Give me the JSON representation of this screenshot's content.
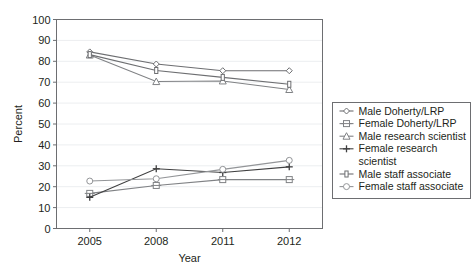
{
  "chart_data": {
    "type": "line",
    "title": "",
    "xlabel": "Year",
    "ylabel": "Percent",
    "categories": [
      "2005",
      "2008",
      "2011",
      "2012"
    ],
    "x": [
      2005,
      2008,
      2011,
      2012
    ],
    "ylim": [
      0,
      100
    ],
    "yticks": [
      0,
      10,
      20,
      30,
      40,
      50,
      60,
      70,
      80,
      90,
      100
    ],
    "grid": true,
    "legend_position": "right",
    "series": [
      {
        "name": "Male Doherty/LRP",
        "marker": "diamond",
        "color": "#6d6e71",
        "values": [
          84.5,
          78.7,
          75.5,
          75.5
        ]
      },
      {
        "name": "Female Doherty/LRP",
        "marker": "square-open",
        "color": "#808285",
        "values": [
          16.8,
          20.6,
          23.4,
          23.4
        ]
      },
      {
        "name": "Male research scientist",
        "marker": "triangle",
        "color": "#808285",
        "values": [
          83.0,
          70.3,
          70.6,
          66.5
        ]
      },
      {
        "name": "Female research scientist",
        "marker": "plus",
        "color": "#404041",
        "values": [
          14.9,
          28.6,
          26.8,
          29.5
        ]
      },
      {
        "name": "Male staff associate",
        "marker": "bar",
        "color": "#6d6e71",
        "values": [
          83.2,
          75.6,
          72.3,
          69.0
        ]
      },
      {
        "name": "Female staff associate",
        "marker": "circle-open",
        "color": "#939598",
        "values": [
          22.7,
          23.8,
          28.3,
          32.6
        ]
      }
    ]
  },
  "legend": {
    "entries": [
      {
        "label": "Male Doherty/LRP"
      },
      {
        "label": "Female Doherty/LRP"
      },
      {
        "label": "Male research scientist"
      },
      {
        "label": "Female research"
      },
      {
        "label": "scientist"
      },
      {
        "label": "Male staff associate"
      },
      {
        "label": "Female staff associate"
      }
    ]
  },
  "colors": {
    "frame": "#6d6e71",
    "grid": "#eceef0",
    "text": "#231f20",
    "background": "#ffffff"
  }
}
